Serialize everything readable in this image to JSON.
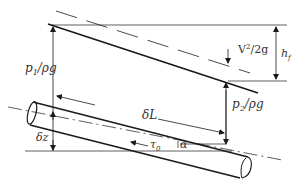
{
  "diagram": {
    "colors": {
      "stroke": "#1a1a1a",
      "text": "#333333",
      "background": "#ffffff"
    },
    "labels": {
      "p1": "p",
      "p1_sub": "1",
      "p1_rest": "/ρg",
      "p2": "p",
      "p2_sub": "2",
      "p2_rest": "/ρg",
      "velocity_head": "V",
      "velocity_head_sup": "2",
      "velocity_head_rest": "/2g",
      "head_loss": "h",
      "head_loss_sub": "f",
      "delta_L": "δL",
      "delta_z": "δz",
      "tau": "τ",
      "tau_sub": "0",
      "alpha": "α"
    }
  }
}
